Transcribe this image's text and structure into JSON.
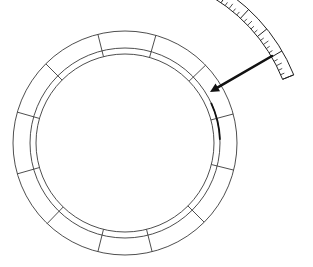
{
  "diagram": {
    "type": "segmented-ring-with-scale",
    "ring": {
      "center": [
        125,
        143
      ],
      "outer_radius": 112,
      "middle_radius": 95,
      "inner_radius": 89,
      "segment_count": 12,
      "divider_angles_deg": [
        14,
        45,
        76,
        104,
        134,
        164,
        196,
        225,
        256,
        286,
        316,
        345
      ],
      "highlight_arc_deg": [
        335,
        358
      ]
    },
    "arrow": {
      "from": [
        272,
        56
      ],
      "to": [
        210,
        92
      ],
      "color": "#111111"
    },
    "scale": {
      "label": "curved graduated scale",
      "arc_center": [
        125,
        143
      ],
      "inner_radius": 170,
      "outer_radius": 182,
      "start_deg": 296,
      "end_deg": 338,
      "major_divisions": 5,
      "minor_per_major": 5
    },
    "colors": {
      "line": "#3a3a3a",
      "ink": "#111111",
      "background": "#ffffff"
    }
  }
}
